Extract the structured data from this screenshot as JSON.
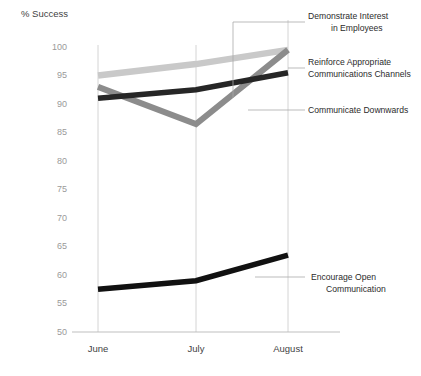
{
  "chart_data": {
    "type": "line",
    "title": "",
    "ylabel": "% Success",
    "xlabel": "",
    "categories": [
      "June",
      "July",
      "August"
    ],
    "ylim": [
      50,
      100
    ],
    "yticks": [
      50,
      55,
      60,
      65,
      70,
      75,
      80,
      85,
      90,
      95,
      100
    ],
    "grid": "vertical-category-gridlines",
    "legend": "annotation-callouts-right",
    "series": [
      {
        "name": "Demonstrate Interest in Employees",
        "values": [
          95,
          97,
          99.5
        ],
        "color": "#c9c9c9"
      },
      {
        "name": "Reinforce Appropriate Communications Channels",
        "values": [
          91,
          92.5,
          95.5
        ],
        "color": "#262626"
      },
      {
        "name": "Communicate Downwards",
        "values": [
          93,
          86.5,
          99.5
        ],
        "color": "#8c8c8c"
      },
      {
        "name": "Encourage Open Communication",
        "values": [
          57.5,
          59,
          63.5
        ],
        "color": "#111111"
      }
    ]
  },
  "axis": {
    "y_title": "% Success",
    "y_tick_labels": [
      "100",
      "95",
      "90",
      "85",
      "80",
      "75",
      "70",
      "65",
      "60",
      "55",
      "50"
    ],
    "x_tick_labels": [
      "June",
      "July",
      "August"
    ]
  },
  "annotations": [
    {
      "id": "demonstrate-interest",
      "line1": "Demonstrate Interest",
      "line2": "in Employees"
    },
    {
      "id": "reinforce-channels",
      "line1": "Reinforce Appropriate",
      "line2": "Communications Channels"
    },
    {
      "id": "communicate-downwards",
      "line1": "Communicate Downwards",
      "line2": ""
    },
    {
      "id": "encourage-open-communication",
      "line1": "Encourage Open",
      "line2": "Communication"
    }
  ]
}
